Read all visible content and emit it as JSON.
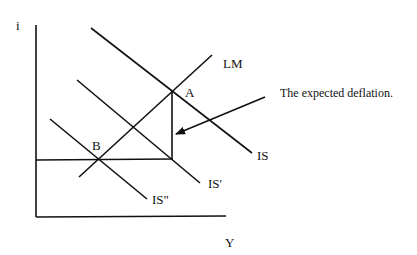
{
  "diagram": {
    "type": "IS-LM diagram",
    "axes": {
      "y_label": "i",
      "x_label": "Y"
    },
    "curves": [
      {
        "id": "IS",
        "label": "IS"
      },
      {
        "id": "IS_prime",
        "label": "IS'"
      },
      {
        "id": "IS_double_prime",
        "label": "IS\""
      },
      {
        "id": "LM",
        "label": "LM"
      }
    ],
    "points": [
      {
        "id": "A",
        "label": "A"
      },
      {
        "id": "B",
        "label": "B"
      }
    ],
    "annotation": {
      "text": "The expected deflation."
    },
    "colors": {
      "ink": "#111111",
      "background": "#ffffff"
    }
  }
}
